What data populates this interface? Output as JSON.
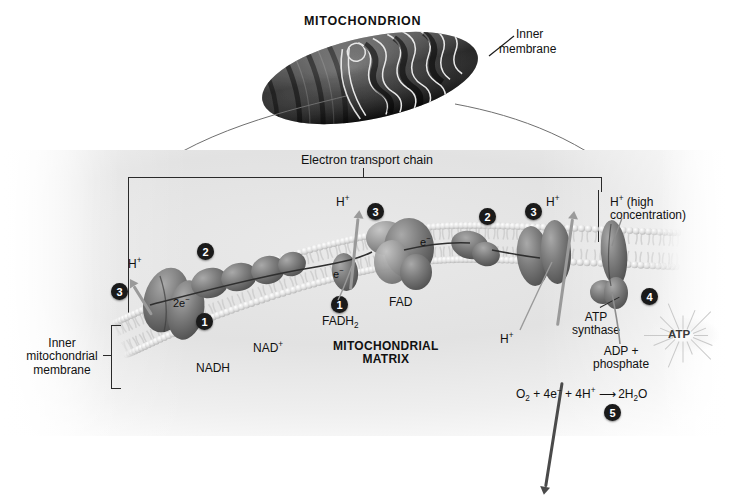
{
  "figure": {
    "title": "MITOCHONDRION",
    "type": "biology-diagram"
  },
  "top": {
    "title": "MITOCHONDRION",
    "inner_membrane_label_line1": "Inner",
    "inner_membrane_label_line2": "membrane"
  },
  "panel": {
    "etc_label": "Electron transport chain",
    "matrix_line1": "MITOCHONDRIAL",
    "matrix_line2": "MATRIX",
    "inner_mito_membrane_line1": "Inner",
    "inner_mito_membrane_line2": "mitochondrial",
    "inner_mito_membrane_line3": "membrane"
  },
  "labels": {
    "h_left": "H",
    "h_mid": "H",
    "h_right": "H",
    "h_synthase": "H",
    "h_high_line1": "H",
    "h_high_line1_rest": " (high",
    "h_high_line2": "concentration)",
    "two_electrons": "2e",
    "electron_1": "e",
    "electron_2": "e",
    "nadh": "NADH",
    "nad_plus": "NAD",
    "fadh2_base": "FADH",
    "fadh2_sub": "2",
    "fad": "FAD",
    "atp_synthase_line1": "ATP",
    "atp_synthase_line2": "synthase",
    "adp_line1": "ADP +",
    "adp_line2": "phosphate",
    "atp": "ATP",
    "superscript_plus": "+",
    "superscript_minus": "−"
  },
  "equation": {
    "o2": "O",
    "o2_sub": "2",
    "plus1": " + 4e",
    "e_sup": "−",
    "plus2": " + 4H",
    "h_sup": "+",
    "arrow": "⟶",
    "product": "2H",
    "product_sub": "2",
    "product_end": "O",
    "step": "5"
  },
  "steps": [
    {
      "n": "1",
      "name": "nadh-dehydrogenase-complex-i"
    },
    {
      "n": "2",
      "name": "electron-carrier-complex-ii"
    },
    {
      "n": "3",
      "name": "proton-pump-left"
    },
    {
      "n": "3",
      "name": "proton-pump-mid"
    },
    {
      "n": "3",
      "name": "proton-pump-right"
    },
    {
      "n": "2",
      "name": "cytochrome-complex"
    },
    {
      "n": "1",
      "name": "fadh2-entry-point"
    },
    {
      "n": "4",
      "name": "atp-synthase-step"
    },
    {
      "n": "5",
      "name": "oxygen-reduction-step"
    }
  ],
  "colors": {
    "ink": "#111111",
    "protein_dark": "#5a5a5a",
    "protein_mid": "#8a8a8a",
    "membrane_head": "#d8d8d8",
    "matrix_bg": "#e6e6e6",
    "arrow_light": "#9a9a9a",
    "arrow_dark": "#4a4a4a"
  }
}
